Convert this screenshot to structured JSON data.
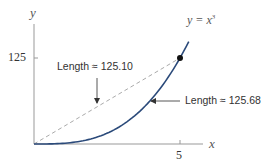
{
  "chart_data": {
    "type": "line",
    "title": "",
    "xlabel": "x",
    "ylabel": "y",
    "xlim": [
      0,
      5.35
    ],
    "ylim": [
      0,
      150
    ],
    "xticks": [
      5
    ],
    "yticks": [
      125
    ],
    "x_tick_labels": [
      "5"
    ],
    "y_tick_labels": [
      "125"
    ],
    "grid": false,
    "legend": null,
    "series": [
      {
        "name": "y = x^3",
        "label": "y = x³",
        "style": "solid",
        "color": "#2b4a7a",
        "x": [
          0,
          0.5,
          1,
          1.5,
          2,
          2.5,
          3,
          3.5,
          4,
          4.5,
          5,
          5.3
        ],
        "y": [
          0,
          0.125,
          1,
          3.375,
          8,
          15.625,
          27,
          42.875,
          64,
          91.125,
          125,
          148.9
        ]
      },
      {
        "name": "secant",
        "label": "straight segment from (0,0) to (5,125)",
        "style": "dashed",
        "color": "#aaaaaa",
        "x": [
          0,
          5
        ],
        "y": [
          0,
          125
        ]
      }
    ],
    "points": [
      {
        "x": 5,
        "y": 125,
        "label": "(5, 125)",
        "color": "#111111"
      }
    ],
    "annotations": [
      {
        "text": "Length ≈ 125.10",
        "target": "secant",
        "arrow": "down"
      },
      {
        "text": "Length ≈ 125.68",
        "target": "curve y = x^3",
        "arrow": "left"
      },
      {
        "text": "y = x³",
        "target": "curve label"
      }
    ]
  },
  "labels": {
    "y_axis": "y",
    "x_axis": "x",
    "y_tick": "125",
    "x_tick": "5",
    "curve_eq_lhs": "y = x",
    "curve_eq_exp": "3",
    "secant_length": "Length ≈ 125.10",
    "curve_length": "Length ≈ 125.68"
  },
  "colors": {
    "curve": "#2b4a7a",
    "secant": "#aaaaaa",
    "axes": "#888888",
    "arrows": "#444444",
    "point": "#111111"
  }
}
